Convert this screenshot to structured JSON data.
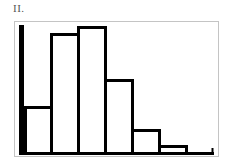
{
  "figure_label": "II.",
  "colors": {
    "bar_stroke": "#000000",
    "bar_fill": "#ffffff",
    "frame": "#c4c4c4",
    "label": "#555555"
  },
  "chart_data": {
    "type": "bar",
    "title": "II.",
    "xlabel": "",
    "ylabel": "",
    "grid": false,
    "legend": null,
    "categories": [
      "bin1",
      "bin2",
      "bin3",
      "bin4",
      "bin5",
      "bin6",
      "bin7"
    ],
    "values": [
      46,
      119,
      126,
      73,
      23,
      7,
      0
    ],
    "ylim": [
      0,
      130
    ],
    "bar_edges_px": [
      24,
      50,
      77,
      104,
      131,
      158,
      185,
      212
    ]
  }
}
